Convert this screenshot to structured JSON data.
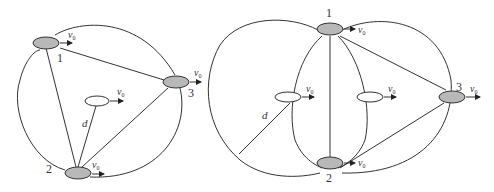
{
  "left_diagram": {
    "nodes": [
      {
        "id": "1",
        "label": "1",
        "velocity": "v",
        "velocity_sub": "0"
      },
      {
        "id": "2",
        "label": "2",
        "velocity": "v",
        "velocity_sub": "0"
      },
      {
        "id": "3",
        "label": "3",
        "velocity": "v",
        "velocity_sub": "0"
      }
    ],
    "center_node": {
      "velocity": "v",
      "velocity_sub": "0"
    },
    "distance_label": "d"
  },
  "right_diagram": {
    "nodes": [
      {
        "id": "1",
        "label": "1",
        "velocity": "v",
        "velocity_sub": "0"
      },
      {
        "id": "2",
        "label": "2",
        "velocity": "v",
        "velocity_sub": "0"
      },
      {
        "id": "3",
        "label": "3",
        "velocity": "v",
        "velocity_sub": "0"
      }
    ],
    "center_nodes": [
      {
        "velocity": "v",
        "velocity_sub": "0"
      },
      {
        "velocity": "v",
        "velocity_sub": "0"
      }
    ],
    "distance_label": "d"
  }
}
